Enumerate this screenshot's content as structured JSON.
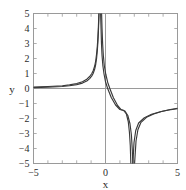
{
  "chart_data": {
    "type": "line",
    "title": "",
    "xlabel": "x",
    "ylabel": "y",
    "xlim": [
      -5,
      5
    ],
    "ylim": [
      -5,
      5
    ],
    "grid": false,
    "legend": null,
    "x_ticks": [
      -5,
      0,
      5
    ],
    "x_tick_labels": [
      "-5",
      "0",
      "5"
    ],
    "y_ticks": [
      -5,
      -4,
      -3,
      -2,
      -1,
      0,
      1,
      2,
      3,
      4,
      5
    ],
    "y_tick_labels": [
      "-5",
      "-4",
      "-3",
      "-2",
      "-1",
      "0",
      "1",
      "2",
      "3",
      "4",
      "5"
    ],
    "minor_x_ticks": [
      -4,
      -3,
      -2,
      -1,
      1,
      2,
      3,
      4
    ],
    "annotations": [],
    "line_color": "#3a3a3a",
    "frame_color": "#9a9a9a",
    "axis_color": "#9a9a9a",
    "background_color": "#ffffff",
    "series": [
      {
        "name": "curve-1",
        "vertical_asymptotes": [
          -0.4,
          1.8
        ],
        "horizontal_asymptote": 0,
        "values_note": "rational curve; branch left of x=-0.4 rises to +inf, middle branch falls from +inf to -inf, right branch rises from -inf toward y=0-",
        "points": [
          [
            -5,
            0.1
          ],
          [
            -4,
            0.13
          ],
          [
            -3,
            0.18
          ],
          [
            -2.5,
            0.24
          ],
          [
            -2,
            0.33
          ],
          [
            -1.6,
            0.45
          ],
          [
            -1.3,
            0.62
          ],
          [
            -1.1,
            0.8
          ],
          [
            -0.95,
            1.0
          ],
          [
            -0.85,
            1.2
          ],
          [
            -0.75,
            1.5
          ],
          [
            -0.68,
            1.85
          ],
          [
            -0.62,
            2.3
          ],
          [
            -0.57,
            2.8
          ],
          [
            -0.53,
            3.4
          ],
          [
            -0.49,
            4.2
          ],
          [
            -0.46,
            5.0
          ],
          [
            -0.34,
            5.0
          ],
          [
            -0.31,
            4.0
          ],
          [
            -0.28,
            3.0
          ],
          [
            -0.24,
            2.2
          ],
          [
            -0.18,
            1.5
          ],
          [
            -0.1,
            0.95
          ],
          [
            0,
            0.45
          ],
          [
            0.15,
            0.0
          ],
          [
            0.4,
            -0.6
          ],
          [
            0.7,
            -1.1
          ],
          [
            1.0,
            -1.4
          ],
          [
            1.25,
            -1.45
          ],
          [
            1.45,
            -1.7
          ],
          [
            1.58,
            -2.2
          ],
          [
            1.66,
            -2.9
          ],
          [
            1.72,
            -3.8
          ],
          [
            1.76,
            -5.0
          ],
          [
            1.9,
            -5.0
          ],
          [
            1.98,
            -3.6
          ],
          [
            2.1,
            -2.8
          ],
          [
            2.3,
            -2.3
          ],
          [
            2.7,
            -1.95
          ],
          [
            3.2,
            -1.72
          ],
          [
            3.8,
            -1.55
          ],
          [
            4.4,
            -1.43
          ],
          [
            5,
            -1.35
          ]
        ]
      },
      {
        "name": "curve-2",
        "vertical_asymptotes": [
          -0.3,
          1.95
        ],
        "horizontal_asymptote": 0,
        "values_note": "second rational curve offset slightly from curve-1; nearly coincident on the far left and far right",
        "points": [
          [
            -5,
            0.06
          ],
          [
            -4,
            0.09
          ],
          [
            -3,
            0.13
          ],
          [
            -2.5,
            0.18
          ],
          [
            -2,
            0.26
          ],
          [
            -1.6,
            0.36
          ],
          [
            -1.3,
            0.5
          ],
          [
            -1.1,
            0.66
          ],
          [
            -0.95,
            0.84
          ],
          [
            -0.85,
            1.02
          ],
          [
            -0.75,
            1.3
          ],
          [
            -0.68,
            1.6
          ],
          [
            -0.62,
            2.0
          ],
          [
            -0.57,
            2.5
          ],
          [
            -0.53,
            3.05
          ],
          [
            -0.49,
            3.8
          ],
          [
            -0.45,
            5.0
          ],
          [
            -0.27,
            5.0
          ],
          [
            -0.24,
            4.0
          ],
          [
            -0.2,
            3.0
          ],
          [
            -0.15,
            2.2
          ],
          [
            -0.08,
            1.5
          ],
          [
            0.02,
            0.95
          ],
          [
            0.15,
            0.42
          ],
          [
            0.3,
            0.0
          ],
          [
            0.55,
            -0.62
          ],
          [
            0.85,
            -1.15
          ],
          [
            1.1,
            -1.42
          ],
          [
            1.35,
            -1.5
          ],
          [
            1.55,
            -1.8
          ],
          [
            1.7,
            -2.35
          ],
          [
            1.8,
            -3.1
          ],
          [
            1.86,
            -4.1
          ],
          [
            1.9,
            -5.0
          ],
          [
            2.02,
            -5.0
          ],
          [
            2.12,
            -3.5
          ],
          [
            2.25,
            -2.75
          ],
          [
            2.45,
            -2.28
          ],
          [
            2.85,
            -1.92
          ],
          [
            3.35,
            -1.7
          ],
          [
            3.95,
            -1.52
          ],
          [
            4.5,
            -1.4
          ],
          [
            5,
            -1.32
          ]
        ]
      }
    ]
  }
}
